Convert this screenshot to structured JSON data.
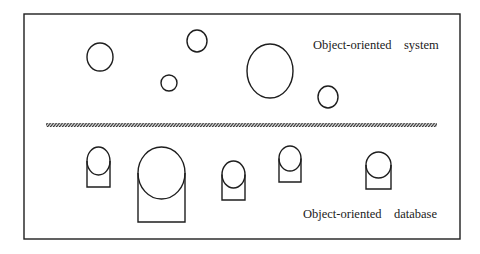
{
  "diagram": {
    "type": "illustration",
    "frame": {
      "x": 24,
      "y": 14,
      "width": 436,
      "height": 225
    },
    "separator": {
      "style": "hatched",
      "x1": 46,
      "x2": 437,
      "y": 123,
      "height": 4
    },
    "top_section": {
      "label": "Object-oriented    system",
      "label_pos": {
        "x": 313,
        "y": 49
      },
      "objects": [
        {
          "shape": "ellipse",
          "cx": 100,
          "cy": 57,
          "rx": 13,
          "ry": 14
        },
        {
          "shape": "ellipse",
          "cx": 197,
          "cy": 41,
          "rx": 10,
          "ry": 11
        },
        {
          "shape": "ellipse",
          "cx": 169,
          "cy": 83,
          "rx": 8,
          "ry": 8
        },
        {
          "shape": "ellipse",
          "cx": 270,
          "cy": 71,
          "rx": 23,
          "ry": 27
        },
        {
          "shape": "ellipse",
          "cx": 328,
          "cy": 97,
          "rx": 10,
          "ry": 11
        }
      ]
    },
    "bottom_section": {
      "label": "Object-oriented    database",
      "label_pos": {
        "x": 303,
        "y": 218
      },
      "objects": [
        {
          "shape": "stored-object",
          "cx": 98.5,
          "cy": 161,
          "rx": 11.5,
          "ry": 14,
          "bottom": 187
        },
        {
          "shape": "stored-object",
          "cx": 161.5,
          "cy": 173,
          "rx": 23.5,
          "ry": 26,
          "bottom": 222
        },
        {
          "shape": "stored-object",
          "cx": 233.5,
          "cy": 174.5,
          "rx": 11.5,
          "ry": 13.5,
          "bottom": 200
        },
        {
          "shape": "stored-object",
          "cx": 290,
          "cy": 158.5,
          "rx": 11,
          "ry": 12.5,
          "bottom": 182
        },
        {
          "shape": "stored-object",
          "cx": 378.5,
          "cy": 165,
          "rx": 12.5,
          "ry": 13,
          "bottom": 189
        }
      ]
    },
    "colors": {
      "stroke": "#1e1e1e",
      "background": "#ffffff"
    }
  }
}
